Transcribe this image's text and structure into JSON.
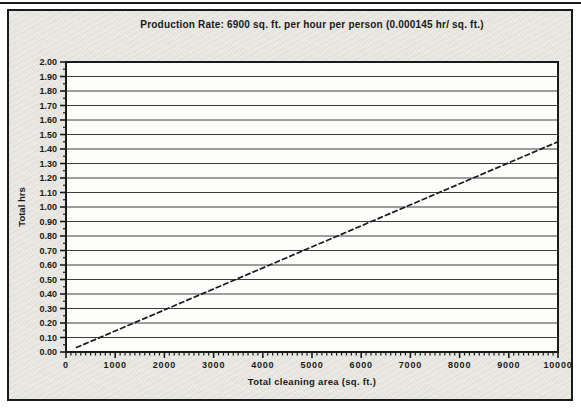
{
  "colors": {
    "ink": "#1a1a1a",
    "figure_bg": "#e8e6e1",
    "plot_bg": "#fdfdfc",
    "grid": "#3d3d3d",
    "line": "#1a1a1a"
  },
  "chart_data": {
    "type": "line",
    "title": "Production Rate: 6900 sq. ft. per hour per person (0.000145 hr/ sq. ft.)",
    "xlabel": "Total cleaning area (sq. ft.)",
    "ylabel": "Total hrs",
    "xlim": [
      0,
      10000
    ],
    "ylim": [
      0.0,
      2.0
    ],
    "xticks": [
      "0",
      "1000",
      "2000",
      "3000",
      "4000",
      "5000",
      "6000",
      "7000",
      "8000",
      "9000",
      "10000"
    ],
    "yticks": [
      "0.00",
      "0.10",
      "0.20",
      "0.30",
      "0.40",
      "0.50",
      "0.60",
      "0.70",
      "0.80",
      "0.90",
      "1.00",
      "1.10",
      "1.20",
      "1.30",
      "1.40",
      "1.50",
      "1.60",
      "1.70",
      "1.80",
      "1.90",
      "2.00"
    ],
    "x_minor_step": 100,
    "y_minor_step": 0.05,
    "grid": "horizontal",
    "legend": "none",
    "slope_hr_per_sqft": 0.000145,
    "series": [
      {
        "name": "Total hrs",
        "style": "dashed",
        "x": [
          200,
          10000
        ],
        "y": [
          0.029,
          1.45
        ]
      }
    ]
  }
}
